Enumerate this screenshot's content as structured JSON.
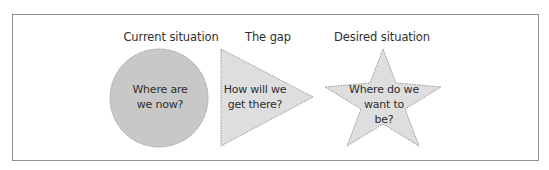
{
  "diagram": {
    "stages": [
      {
        "heading": "Current situation",
        "shape": "circle",
        "question": "Where are\nwe now?",
        "fill": "#c8c8c8"
      },
      {
        "heading": "The gap",
        "shape": "triangle",
        "question": "How will we\nget there?",
        "fill": "#dedede"
      },
      {
        "heading": "Desired situation",
        "shape": "star",
        "question": "Where do we\nwant to\nbe?",
        "fill": "#dedede"
      }
    ],
    "colors": {
      "border": "#8f8f8f",
      "shape_outline": "#9a9a9a"
    }
  }
}
